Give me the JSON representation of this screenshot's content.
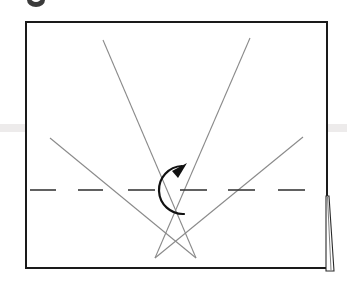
{
  "figure": {
    "background_color": "#ffffff",
    "canvas": {
      "width": 347,
      "height": 285
    },
    "outline_color": "#1a1a1a",
    "construction_line_color": "#8a8a8a",
    "centerline_color": "#3a3a3a",
    "arrow_color": "#111111",
    "ink_smudge_color": "#3b3b3b",
    "scan_band_color": "#eceaea"
  },
  "plate": {
    "name": "outer-rectangle",
    "x": 26,
    "y": 22,
    "width": 301,
    "height": 246,
    "stroke_width": 2
  },
  "centerline": {
    "name": "horizontal-centerline",
    "y": 190,
    "stroke_width": 1.6,
    "dashes": [
      {
        "x1": 30,
        "x2": 56
      },
      {
        "x1": 78,
        "x2": 103
      },
      {
        "x1": 128,
        "x2": 155
      },
      {
        "x1": 180,
        "x2": 207
      },
      {
        "x1": 228,
        "x2": 255
      },
      {
        "x1": 278,
        "x2": 305
      }
    ]
  },
  "crossings": [
    {
      "name": "left-crossing",
      "cx": 102,
      "cy": 190
    },
    {
      "name": "right-crossing",
      "cx": 252,
      "cy": 190
    }
  ],
  "diagonals": [
    {
      "name": "diagonal-upper-left-to-lower-right",
      "x1": 103,
      "y1": 40,
      "x2": 196,
      "y2": 258
    },
    {
      "name": "diagonal-upper-right-to-lower-left",
      "x1": 250,
      "y1": 38,
      "x2": 155,
      "y2": 258
    },
    {
      "name": "diagonal-mid-left-to-lower-right",
      "x1": 50,
      "y1": 138,
      "x2": 196,
      "y2": 258
    },
    {
      "name": "diagonal-mid-right-to-lower-left",
      "x1": 303,
      "y1": 137,
      "x2": 155,
      "y2": 258
    }
  ],
  "rotation_arrow": {
    "name": "counterclockwise-rotation-arrow",
    "center_x": 180,
    "center_y": 190,
    "radius": 24,
    "stroke_width": 2.2,
    "arrowhead": {
      "tip_x": 186,
      "tip_y": 163
    },
    "direction": "counterclockwise"
  },
  "edge_wedge": {
    "name": "page-edge-wedge-sliver",
    "top_y": 196,
    "bottom_y": 271,
    "left_x": 326,
    "top_width": 3,
    "bottom_width": 8
  },
  "ink_mark": {
    "name": "cropped-ellipse-mark",
    "cx": 36,
    "cy": 0,
    "rx": 9,
    "ry": 7
  }
}
